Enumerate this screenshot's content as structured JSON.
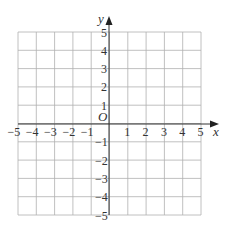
{
  "diagram": {
    "type": "coordinate-grid",
    "x_axis_label": "x",
    "y_axis_label": "y",
    "origin_label": "O",
    "x_range": [
      -5,
      5
    ],
    "y_range": [
      -5,
      5
    ],
    "x_ticks": [
      "−5",
      "−4",
      "−3",
      "−2",
      "−1",
      "1",
      "2",
      "3",
      "4",
      "5"
    ],
    "y_ticks": [
      "5",
      "4",
      "3",
      "2",
      "1",
      "−1",
      "−2",
      "−3",
      "−4",
      "−5"
    ],
    "grid": true,
    "colors": {
      "grid": "#b0b0b0",
      "axis": "#333333",
      "background": "#ffffff"
    }
  }
}
